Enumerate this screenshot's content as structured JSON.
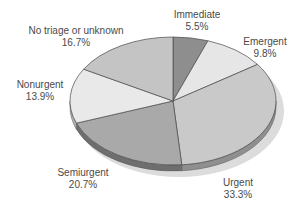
{
  "chart_data": {
    "type": "pie",
    "title": "",
    "style": "3d-tilted",
    "start_angle": "12 o'clock, clockwise",
    "categories": [
      "Immediate",
      "Emergent",
      "Urgent",
      "Semiurgent",
      "Nonurgent",
      "No triage or unknown"
    ],
    "values": [
      5.5,
      9.8,
      33.3,
      20.7,
      13.9,
      16.7
    ],
    "value_labels": [
      "5.5%",
      "9.8%",
      "33.3%",
      "20.7%",
      "13.9%",
      "16.7%"
    ],
    "colors": [
      "#8e8e8e",
      "#e6e6e6",
      "#c9c9c9",
      "#a9a9a9",
      "#e9e9e9",
      "#c4c4c4"
    ],
    "side_colors": [
      "#6a6a6a",
      "#b0b0b0",
      "#8f8f8f",
      "#6e6e6e",
      "#b5b5b5",
      "#8a8a8a"
    ],
    "legend": "none (direct labels)"
  },
  "labels": [
    {
      "name": "Immediate",
      "pct": "5.5%",
      "x": 197,
      "y": 9
    },
    {
      "name": "Emergent",
      "pct": "9.8%",
      "x": 265,
      "y": 36
    },
    {
      "name": "Urgent",
      "pct": "33.3%",
      "x": 238,
      "y": 177
    },
    {
      "name": "Semiurgent",
      "pct": "20.7%",
      "x": 83,
      "y": 167
    },
    {
      "name": "Nonurgent",
      "pct": "13.9%",
      "x": 40,
      "y": 79
    },
    {
      "name": "No triage or unknown",
      "pct": "16.7%",
      "x": 76,
      "y": 25
    }
  ]
}
